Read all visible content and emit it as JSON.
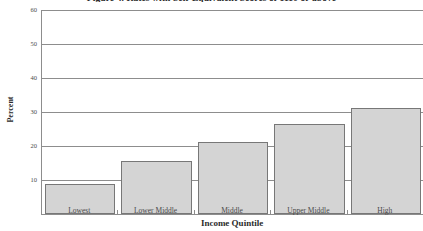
{
  "figure": {
    "title": "Figure 4. Rates with Self-Equivalent Scores of 1110 or above",
    "title_truncated": true
  },
  "chart_data": {
    "type": "bar",
    "title": "Figure 4. Rates with Self-Equivalent Scores of 1110 or above",
    "categories": [
      "Lowest",
      "Lower Middle",
      "Middle",
      "Upper Middle",
      "High"
    ],
    "values": [
      8.7,
      15.5,
      21.3,
      26.5,
      31.2
    ],
    "xlabel": "Income Quintile",
    "ylabel": "Percent",
    "ylim": [
      0,
      60
    ],
    "yticks": [
      10,
      20,
      30,
      40,
      50,
      60
    ],
    "ytick_labels": [
      "10",
      "20",
      "30",
      "40",
      "50",
      "60"
    ],
    "grid": true,
    "legend": false,
    "bar_color": "#d4d4d4",
    "bar_edge_color": "#777777",
    "axis_color": "#8d8d8d"
  }
}
